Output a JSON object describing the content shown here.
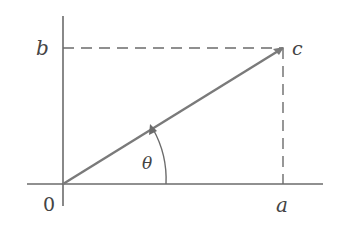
{
  "diagram": {
    "labels": {
      "origin": "0",
      "x_projection": "a",
      "y_projection": "b",
      "point": "c",
      "angle": "θ"
    },
    "colors": {
      "axis": "#6b6b6b",
      "vector": "#7a7a7a",
      "dashed": "#6b6b6b",
      "text": "#444444"
    }
  }
}
